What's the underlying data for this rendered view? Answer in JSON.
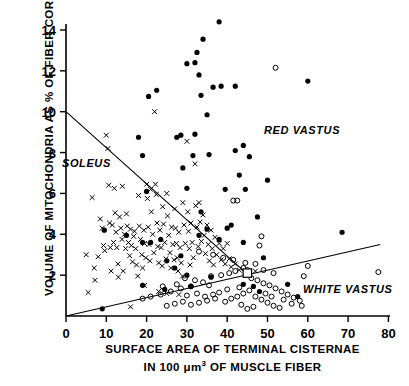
{
  "axes": {
    "ylabel": "VOLUME OF MITOCHONDRIA AS % OF FIBER CORE",
    "xlabel_line1": "SURFACE AREA OF TERMINAL CISTERNAE",
    "xlabel_line2_pre": "IN 100 ",
    "xlabel_line2_mu": "μm",
    "xlabel_line2_sup": "3",
    "xlabel_line2_post": " OF MUSCLE FIBER",
    "xticks": [
      "0",
      "10",
      "20",
      "30",
      "40",
      "50",
      "60",
      "70",
      "80"
    ],
    "yticks": [
      "2",
      "4",
      "6",
      "8",
      "10",
      "12",
      "14"
    ]
  },
  "groups": {
    "soleus": "SOLEUS",
    "red_vastus": "RED VASTUS",
    "white_vastus": "WHITE VASTUS"
  },
  "colors": {
    "ink": "#000000",
    "paper": "#ffffff"
  },
  "chart_data": {
    "type": "scatter",
    "title": "",
    "xlabel": "SURFACE AREA OF TERMINAL CISTERNAE IN 100 μm3 OF MUSCLE FIBER",
    "ylabel": "VOLUME OF MITOCHONDRIA AS % OF FIBER CORE",
    "xlim": [
      0,
      80
    ],
    "ylim": [
      0,
      14.8
    ],
    "xticks": [
      0,
      10,
      20,
      30,
      40,
      50,
      60,
      70,
      80
    ],
    "yticks": [
      2,
      4,
      6,
      8,
      10,
      12,
      14
    ],
    "grid": false,
    "legend": "inline-italic-labels",
    "series": [
      {
        "name": "SOLEUS",
        "marker": "x",
        "points": [
          [
            5.0,
            3.0
          ],
          [
            5.5,
            1.15
          ],
          [
            6.5,
            5.8
          ],
          [
            7.0,
            2.35
          ],
          [
            7.2,
            1.75
          ],
          [
            8.0,
            2.9
          ],
          [
            8.5,
            4.75
          ],
          [
            9.0,
            4.3
          ],
          [
            9.3,
            3.45
          ],
          [
            9.6,
            3.2
          ],
          [
            10.0,
            8.85
          ],
          [
            10.4,
            8.2
          ],
          [
            10.6,
            6.4
          ],
          [
            10.8,
            4.55
          ],
          [
            11.0,
            3.35
          ],
          [
            11.2,
            2.2
          ],
          [
            11.5,
            4.45
          ],
          [
            11.8,
            3.6
          ],
          [
            12.0,
            6.25
          ],
          [
            12.2,
            5.05
          ],
          [
            12.4,
            4.1
          ],
          [
            12.6,
            3.35
          ],
          [
            12.9,
            2.55
          ],
          [
            13.0,
            1.9
          ],
          [
            13.3,
            4.85
          ],
          [
            13.6,
            4.3
          ],
          [
            13.9,
            3.75
          ],
          [
            14.0,
            6.35
          ],
          [
            14.2,
            2.2
          ],
          [
            14.5,
            4.0
          ],
          [
            14.8,
            3.3
          ],
          [
            15.0,
            5.0
          ],
          [
            15.2,
            4.4
          ],
          [
            15.5,
            3.6
          ],
          [
            15.8,
            2.95
          ],
          [
            16.0,
            4.25
          ],
          [
            16.2,
            3.45
          ],
          [
            16.5,
            2.65
          ],
          [
            16.8,
            3.9
          ],
          [
            17.0,
            4.15
          ],
          [
            17.3,
            3.3
          ],
          [
            17.5,
            2.5
          ],
          [
            17.8,
            1.95
          ],
          [
            18.0,
            5.9
          ],
          [
            18.2,
            4.4
          ],
          [
            18.5,
            3.75
          ],
          [
            18.8,
            3.0
          ],
          [
            19.0,
            2.35
          ],
          [
            19.3,
            4.2
          ],
          [
            19.5,
            3.55
          ],
          [
            19.8,
            2.85
          ],
          [
            20.0,
            6.45
          ],
          [
            20.2,
            5.75
          ],
          [
            20.4,
            4.35
          ],
          [
            20.6,
            3.5
          ],
          [
            20.8,
            2.7
          ],
          [
            21.0,
            6.2
          ],
          [
            21.2,
            5.1
          ],
          [
            21.5,
            4.0
          ],
          [
            21.8,
            3.1
          ],
          [
            22.0,
            10.0
          ],
          [
            22.2,
            6.45
          ],
          [
            22.4,
            5.95
          ],
          [
            22.6,
            4.55
          ],
          [
            22.8,
            3.4
          ],
          [
            23.0,
            2.6
          ],
          [
            23.3,
            4.2
          ],
          [
            23.6,
            3.35
          ],
          [
            23.9,
            2.45
          ],
          [
            24.0,
            5.35
          ],
          [
            24.2,
            4.5
          ],
          [
            24.5,
            3.6
          ],
          [
            24.8,
            2.8
          ],
          [
            25.0,
            6.0
          ],
          [
            25.2,
            4.9
          ],
          [
            25.5,
            3.95
          ],
          [
            25.8,
            3.1
          ],
          [
            26.0,
            2.35
          ],
          [
            26.2,
            4.35
          ],
          [
            26.5,
            3.5
          ],
          [
            26.8,
            2.75
          ],
          [
            27.0,
            5.25
          ],
          [
            27.2,
            4.3
          ],
          [
            27.4,
            3.55
          ],
          [
            27.6,
            2.85
          ],
          [
            27.8,
            2.2
          ],
          [
            28.0,
            4.1
          ],
          [
            28.3,
            3.35
          ],
          [
            28.6,
            2.6
          ],
          [
            28.9,
            1.95
          ],
          [
            29.0,
            5.55
          ],
          [
            29.3,
            4.45
          ],
          [
            29.6,
            3.55
          ],
          [
            30.0,
            8.55
          ],
          [
            30.2,
            5.1
          ],
          [
            30.4,
            4.15
          ],
          [
            30.6,
            3.3
          ],
          [
            30.8,
            2.5
          ],
          [
            31.0,
            4.55
          ],
          [
            31.3,
            3.6
          ],
          [
            31.6,
            2.85
          ],
          [
            32.0,
            7.45
          ],
          [
            32.2,
            5.4
          ],
          [
            32.5,
            4.35
          ],
          [
            32.8,
            3.4
          ],
          [
            33.0,
            5.55
          ],
          [
            33.3,
            4.6
          ],
          [
            33.6,
            3.65
          ],
          [
            34.0,
            4.95
          ],
          [
            34.3,
            3.95
          ],
          [
            34.6,
            3.05
          ],
          [
            35.0,
            4.45
          ],
          [
            35.3,
            3.5
          ],
          [
            35.6,
            2.7
          ],
          [
            36.0,
            4.2
          ],
          [
            36.3,
            3.3
          ],
          [
            36.6,
            2.5
          ],
          [
            37.0,
            3.85
          ],
          [
            37.4,
            3.0
          ],
          [
            38.0,
            3.55
          ],
          [
            38.5,
            2.75
          ],
          [
            39.0,
            3.3
          ],
          [
            39.5,
            2.55
          ],
          [
            40.0,
            3.55
          ],
          [
            40.5,
            2.8
          ],
          [
            41.0,
            2.4
          ],
          [
            42.0,
            2.55
          ],
          [
            43.0,
            2.25
          ],
          [
            44.5,
            2.15
          ],
          [
            45.5,
            2.1
          ],
          [
            47.0,
            2.2
          ],
          [
            16.0,
            0.45
          ],
          [
            19.5,
            1.5
          ],
          [
            23.0,
            1.2
          ],
          [
            25.0,
            1.1
          ],
          [
            28.0,
            1.05
          ]
        ]
      },
      {
        "name": "RED VASTUS",
        "marker": "filled-circle",
        "points": [
          [
            38.0,
            14.4
          ],
          [
            34.0,
            13.55
          ],
          [
            32.5,
            12.9
          ],
          [
            32.0,
            12.4
          ],
          [
            30.0,
            12.35
          ],
          [
            33.0,
            11.8
          ],
          [
            38.5,
            11.25
          ],
          [
            42.0,
            11.25
          ],
          [
            36.5,
            11.2
          ],
          [
            20.5,
            10.75
          ],
          [
            22.5,
            11.05
          ],
          [
            35.0,
            9.85
          ],
          [
            33.5,
            10.8
          ],
          [
            44.0,
            8.35
          ],
          [
            42.0,
            8.1
          ],
          [
            45.5,
            7.8
          ],
          [
            31.5,
            7.85
          ],
          [
            35.5,
            7.9
          ],
          [
            19.0,
            7.85
          ],
          [
            18.0,
            8.75
          ],
          [
            28.5,
            8.85
          ],
          [
            32.0,
            8.9
          ],
          [
            27.5,
            8.75
          ],
          [
            29.0,
            7.25
          ],
          [
            43.0,
            6.9
          ],
          [
            50.0,
            6.65
          ],
          [
            39.5,
            6.2
          ],
          [
            44.5,
            6.2
          ],
          [
            30.0,
            6.25
          ],
          [
            20.0,
            6.1
          ],
          [
            47.5,
            4.85
          ],
          [
            41.0,
            4.45
          ],
          [
            33.5,
            5.1
          ],
          [
            35.0,
            4.25
          ],
          [
            40.0,
            4.3
          ],
          [
            9.5,
            4.2
          ],
          [
            15.0,
            3.95
          ],
          [
            19.0,
            3.6
          ],
          [
            21.0,
            3.6
          ],
          [
            23.5,
            3.75
          ],
          [
            33.0,
            3.95
          ],
          [
            38.0,
            3.75
          ],
          [
            44.0,
            3.6
          ],
          [
            49.0,
            2.85
          ],
          [
            55.0,
            1.55
          ],
          [
            57.5,
            0.95
          ],
          [
            68.5,
            4.1
          ],
          [
            60.0,
            11.5
          ],
          [
            30.0,
            2.0
          ],
          [
            31.0,
            1.45
          ],
          [
            19.0,
            1.5
          ],
          [
            9.0,
            0.35
          ],
          [
            24.5,
            1.3
          ],
          [
            27.0,
            2.35
          ],
          [
            36.0,
            1.9
          ],
          [
            44.0,
            1.55
          ],
          [
            46.5,
            1.45
          ],
          [
            48.0,
            1.2
          ],
          [
            25.0,
            2.7
          ],
          [
            28.5,
            2.95
          ]
        ]
      },
      {
        "name": "WHITE VASTUS",
        "marker": "open-circle",
        "points": [
          [
            52.0,
            12.15
          ],
          [
            41.5,
            5.65
          ],
          [
            42.5,
            5.65
          ],
          [
            48.5,
            3.9
          ],
          [
            48.0,
            3.45
          ],
          [
            60.0,
            2.45
          ],
          [
            59.0,
            1.95
          ],
          [
            77.5,
            2.15
          ],
          [
            44.0,
            2.35
          ],
          [
            45.0,
            2.25
          ],
          [
            42.0,
            2.2
          ],
          [
            40.5,
            2.1
          ],
          [
            38.5,
            2.0
          ],
          [
            36.0,
            1.95
          ],
          [
            34.0,
            1.65
          ],
          [
            31.0,
            1.45
          ],
          [
            28.5,
            1.35
          ],
          [
            26.0,
            1.2
          ],
          [
            23.5,
            1.05
          ],
          [
            21.0,
            0.95
          ],
          [
            19.0,
            0.85
          ],
          [
            46.0,
            1.85
          ],
          [
            47.5,
            1.75
          ],
          [
            49.0,
            1.6
          ],
          [
            50.5,
            1.5
          ],
          [
            52.0,
            1.35
          ],
          [
            53.5,
            1.2
          ],
          [
            55.0,
            1.05
          ],
          [
            56.5,
            0.9
          ],
          [
            58.0,
            0.75
          ],
          [
            45.5,
            1.25
          ],
          [
            44.0,
            1.1
          ],
          [
            42.5,
            0.95
          ],
          [
            41.0,
            0.85
          ],
          [
            39.5,
            0.7
          ],
          [
            47.0,
            0.95
          ],
          [
            48.5,
            0.8
          ],
          [
            50.0,
            0.65
          ],
          [
            51.5,
            0.5
          ],
          [
            53.0,
            0.4
          ],
          [
            46.5,
            0.45
          ],
          [
            45.0,
            0.35
          ],
          [
            43.5,
            0.55
          ],
          [
            37.0,
            0.85
          ],
          [
            35.0,
            0.75
          ],
          [
            33.0,
            0.65
          ],
          [
            31.0,
            0.55
          ],
          [
            29.0,
            0.7
          ],
          [
            27.0,
            0.6
          ],
          [
            25.0,
            0.5
          ],
          [
            30.0,
            1.0
          ],
          [
            32.5,
            1.1
          ],
          [
            34.5,
            0.95
          ],
          [
            36.5,
            1.05
          ],
          [
            38.0,
            1.15
          ],
          [
            40.0,
            1.3
          ],
          [
            43.0,
            1.4
          ],
          [
            49.5,
            1.1
          ],
          [
            51.0,
            0.95
          ],
          [
            54.0,
            0.8
          ],
          [
            56.0,
            0.6
          ],
          [
            58.5,
            0.5
          ],
          [
            47.0,
            2.55
          ],
          [
            44.5,
            2.6
          ],
          [
            41.5,
            2.75
          ],
          [
            39.0,
            2.85
          ],
          [
            36.5,
            3.0
          ],
          [
            49.0,
            2.25
          ],
          [
            51.5,
            2.1
          ],
          [
            33.0,
            3.15
          ],
          [
            35.5,
            1.5
          ],
          [
            32.0,
            1.75
          ],
          [
            29.5,
            1.85
          ],
          [
            27.5,
            1.55
          ],
          [
            24.0,
            1.45
          ]
        ]
      }
    ],
    "regression_lines": [
      {
        "name": "soleus-line",
        "x0": 0,
        "y0": 10.0,
        "x1": 45.0,
        "y1": 2.05
      },
      {
        "name": "white-vastus-line",
        "x0": 0,
        "y0": 0.0,
        "x1": 78.0,
        "y1": 3.5
      }
    ],
    "markers_special": [
      {
        "name": "intersection-square",
        "x": 45.0,
        "y": 2.1,
        "marker": "open-square"
      }
    ]
  }
}
